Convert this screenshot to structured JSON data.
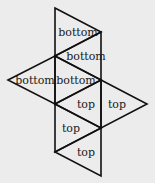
{
  "diagram": {
    "type": "net of a solid (triangular faces)",
    "line_color": "#111111",
    "background": "#ececec",
    "faces": [
      {
        "id": "f1",
        "label": "bottom",
        "points": [
          [
            55,
            8
          ],
          [
            101,
            32
          ],
          [
            55,
            56
          ]
        ],
        "label_pos": [
          78,
          36
        ]
      },
      {
        "id": "f2",
        "label": "bottom",
        "points": [
          [
            55,
            56
          ],
          [
            101,
            32
          ],
          [
            101,
            80
          ]
        ],
        "label_pos": [
          86,
          60
        ]
      },
      {
        "id": "f3",
        "label": "bottom",
        "points": [
          [
            8,
            80
          ],
          [
            55,
            56
          ],
          [
            55,
            104
          ]
        ],
        "label_pos": [
          35,
          84
        ]
      },
      {
        "id": "f4",
        "label": "bottom",
        "points": [
          [
            55,
            56
          ],
          [
            101,
            80
          ],
          [
            55,
            104
          ]
        ],
        "label_pos": [
          76,
          84
        ]
      },
      {
        "id": "f5",
        "label": "top",
        "points": [
          [
            55,
            104
          ],
          [
            101,
            80
          ],
          [
            101,
            128
          ]
        ],
        "label_pos": [
          86,
          108
        ]
      },
      {
        "id": "f6",
        "label": "top",
        "points": [
          [
            101,
            80
          ],
          [
            147,
            104
          ],
          [
            101,
            128
          ]
        ],
        "label_pos": [
          117,
          108
        ]
      },
      {
        "id": "f7",
        "label": "top",
        "points": [
          [
            55,
            104
          ],
          [
            101,
            128
          ],
          [
            55,
            152
          ]
        ],
        "label_pos": [
          71,
          132
        ]
      },
      {
        "id": "f8",
        "label": "top",
        "points": [
          [
            55,
            152
          ],
          [
            101,
            128
          ],
          [
            101,
            176
          ]
        ],
        "label_pos": [
          86,
          156
        ]
      }
    ]
  }
}
